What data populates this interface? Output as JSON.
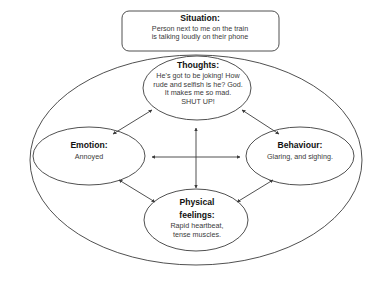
{
  "diagram": {
    "type": "cbt-hot-cross-bun",
    "title_visible": false,
    "background_color": "#ffffff",
    "stroke_color": "#3c3c3c",
    "heading_color": "#111111",
    "body_color": "#3a3a3a",
    "outer_boundary": {
      "shape": "ellipse",
      "name": "outer-context-ellipse"
    },
    "nodes": {
      "situation": {
        "shape": "rounded-rectangle",
        "title": "Situation:",
        "body_line_1": "Person next to me on the train",
        "body_line_2": "is talking loudly on their phone"
      },
      "thoughts": {
        "shape": "ellipse",
        "title": "Thoughts:",
        "body_line_1": "He's got to be joking! How",
        "body_line_2": "rude and selfish is he? God.",
        "body_line_3": "It makes me so mad.",
        "body_line_4": "SHUT UP!"
      },
      "emotion": {
        "shape": "ellipse",
        "title": "Emotion:",
        "body_line_1": "Annoyed"
      },
      "behaviour": {
        "shape": "ellipse",
        "title": "Behaviour:",
        "body_line_1": "Glaring, and sighing."
      },
      "physical": {
        "shape": "ellipse",
        "title_line_1": "Physical",
        "title_line_2": "feelings:",
        "body_line_1": "Rapid heartbeat,",
        "body_line_2": "tense muscles."
      }
    },
    "connectors": [
      {
        "name": "arrow-thoughts-emotion",
        "from": "thoughts",
        "to": "emotion",
        "heads": "double",
        "orientation": "diagonal"
      },
      {
        "name": "arrow-thoughts-behaviour",
        "from": "thoughts",
        "to": "behaviour",
        "heads": "double",
        "orientation": "diagonal"
      },
      {
        "name": "arrow-emotion-physical",
        "from": "emotion",
        "to": "physical",
        "heads": "double",
        "orientation": "diagonal"
      },
      {
        "name": "arrow-behaviour-physical",
        "from": "behaviour",
        "to": "physical",
        "heads": "double",
        "orientation": "diagonal"
      },
      {
        "name": "arrow-vertical-center",
        "from": "thoughts",
        "to": "physical",
        "heads": "double",
        "orientation": "vertical"
      },
      {
        "name": "arrow-horizontal-center",
        "from": "emotion",
        "to": "behaviour",
        "heads": "double",
        "orientation": "horizontal"
      }
    ]
  }
}
